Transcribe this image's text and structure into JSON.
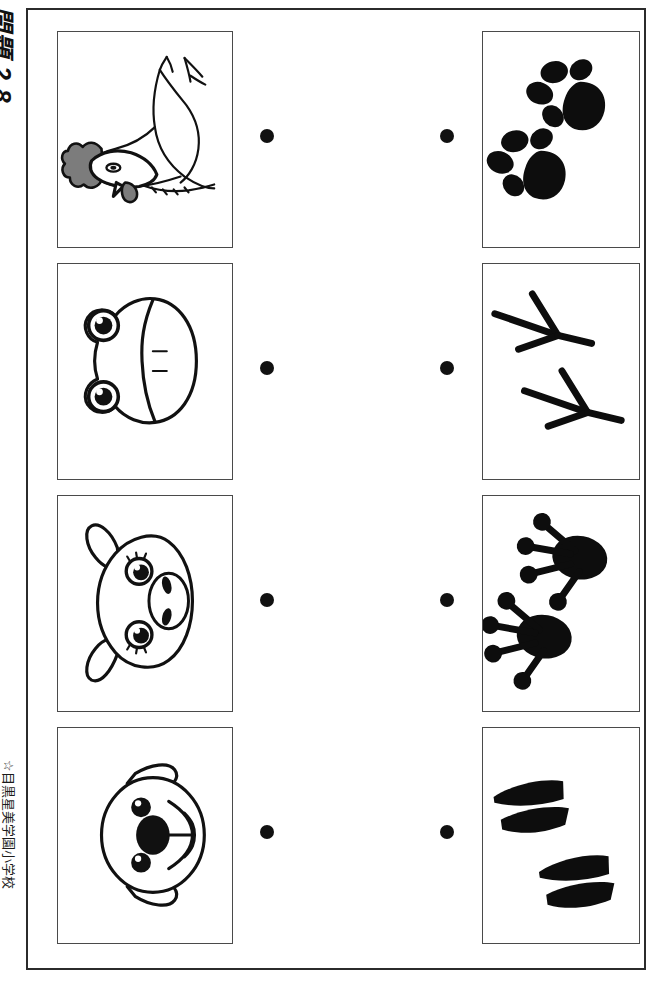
{
  "worksheet": {
    "number_label": "問題 2 8",
    "school_label": "☆目黒星美学園小学校",
    "orientation": "rotated-90",
    "instruction_type": "matching",
    "colors": {
      "ink": "#111111",
      "frame": "#2b2b2b",
      "box_border": "#4a4a4a",
      "accent_gray": "#7c7c7c",
      "paper": "#ffffff"
    }
  },
  "rows": [
    {
      "index": 1,
      "left": {
        "name": "chicken",
        "label_ja": "にわとり",
        "description": "rooster / hen seen from the side, gray comb and wattle"
      },
      "right": {
        "name": "dog-paw-prints",
        "label_ja": "いぬの足あと",
        "description": "two black paw prints with four toe pads and a heel pad",
        "print_count": 2
      },
      "dots": {
        "left": "connector-dot",
        "right": "connector-dot"
      }
    },
    {
      "index": 2,
      "left": {
        "name": "frog",
        "label_ja": "かえる",
        "description": "frog face with two large round eyes and a wide mouth"
      },
      "right": {
        "name": "bird-foot-prints",
        "label_ja": "とりの足あと",
        "description": "two three-toed bird tracks drawn as thin lines with rear spur",
        "print_count": 2
      },
      "dots": {
        "left": "connector-dot",
        "right": "connector-dot"
      }
    },
    {
      "index": 3,
      "left": {
        "name": "pig",
        "label_ja": "ぶた",
        "description": "pig face with floppy ears and a round snout with two nostrils"
      },
      "right": {
        "name": "frog-foot-prints",
        "label_ja": "かえるの足あと",
        "description": "two black webbed frog tracks with round toe pads",
        "print_count": 2
      },
      "dots": {
        "left": "connector-dot",
        "right": "connector-dot"
      }
    },
    {
      "index": 4,
      "left": {
        "name": "dog",
        "label_ja": "いぬ",
        "description": "dog face with floppy ears, black nose and round muzzle"
      },
      "right": {
        "name": "pig-hoof-prints",
        "label_ja": "ぶたの足あと",
        "description": "two cloven hoof prints, each made of two black wedges",
        "print_count": 2
      },
      "dots": {
        "left": "connector-dot",
        "right": "connector-dot"
      }
    }
  ]
}
